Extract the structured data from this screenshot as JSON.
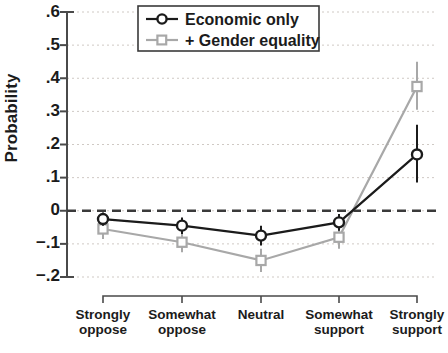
{
  "chart_data": {
    "type": "line",
    "title": "",
    "xlabel": "",
    "ylabel": "Probability",
    "ylim": [
      -0.2,
      0.6
    ],
    "yticks": [
      0.6,
      0.5,
      0.4,
      0.3,
      0.2,
      0.1,
      0,
      -0.1,
      -0.2
    ],
    "ytick_labels": [
      ".6",
      ".5",
      ".4",
      ".3",
      ".2",
      ".1",
      "0",
      "−.1",
      "−.2"
    ],
    "grid": true,
    "zero_reference_line": 0,
    "legend_position": "top-center",
    "categories": [
      "Strongly oppose",
      "Somewhat oppose",
      "Neutral",
      "Somewhat support",
      "Strongly support"
    ],
    "category_lines": [
      [
        "Strongly",
        "oppose"
      ],
      [
        "Somewhat",
        "oppose"
      ],
      [
        "Neutral",
        ""
      ],
      [
        "Somewhat",
        "support"
      ],
      [
        "Strongly",
        "support"
      ]
    ],
    "series": [
      {
        "name": "Economic only",
        "color": "#1b1b1b",
        "marker": "circle",
        "values": [
          -0.025,
          -0.045,
          -0.075,
          -0.035,
          0.17
        ],
        "ci_low": [
          -0.045,
          -0.07,
          -0.105,
          -0.06,
          0.085
        ],
        "ci_high": [
          -0.005,
          -0.02,
          -0.045,
          -0.01,
          0.26
        ]
      },
      {
        "name": "+ Gender equality",
        "color": "#a8a8a8",
        "marker": "square",
        "values": [
          -0.055,
          -0.095,
          -0.15,
          -0.08,
          0.375
        ],
        "ci_low": [
          -0.085,
          -0.125,
          -0.185,
          -0.115,
          0.305
        ],
        "ci_high": [
          -0.025,
          -0.065,
          -0.115,
          -0.045,
          0.45
        ]
      }
    ]
  },
  "legend": {
    "items": [
      {
        "label": "Economic only"
      },
      {
        "label": "+ Gender equality"
      }
    ]
  }
}
